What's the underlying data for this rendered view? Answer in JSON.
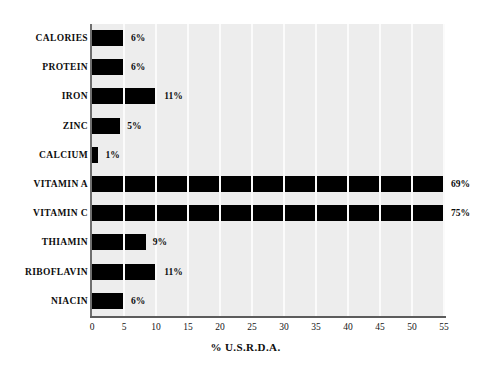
{
  "chart_data": {
    "type": "bar",
    "orientation": "horizontal",
    "title": "",
    "xlabel": "% U.S.R.D.A.",
    "ylabel": "",
    "xlim": [
      0,
      55
    ],
    "xticks": [
      0,
      5,
      10,
      15,
      20,
      25,
      30,
      35,
      40,
      45,
      50,
      55
    ],
    "grid": "vertical",
    "legend": "none",
    "note": "Vitamin A and Vitamin C bars are clipped at the axis maximum of 55; their true values are shown in the data labels.",
    "categories": [
      "CALORIES",
      "PROTEIN",
      "IRON",
      "ZINC",
      "CALCIUM",
      "VITAMIN A",
      "VITAMIN C",
      "THIAMIN",
      "RIBOFLAVIN",
      "NIACIN"
    ],
    "values": [
      6,
      6,
      11,
      5,
      1,
      69,
      75,
      9,
      11,
      6
    ],
    "bar_draw_values": [
      5,
      5,
      10.2,
      4.4,
      1,
      55,
      55,
      8.4,
      10.2,
      5
    ],
    "data_labels": [
      "6%",
      "6%",
      "11%",
      "5%",
      "1%",
      "69%",
      "75%",
      "9%",
      "11%",
      "6%"
    ],
    "tick_labels": [
      "0",
      "5",
      "10",
      "15",
      "20",
      "25",
      "30",
      "35",
      "40",
      "45",
      "50",
      "55"
    ],
    "colors": {
      "bar": "#000000",
      "plot_background": "#ededed",
      "gridline": "#fbfbfb",
      "axis": "#5c5c5c",
      "text": "#0d0d0d",
      "page_background": "#ffffff"
    }
  }
}
